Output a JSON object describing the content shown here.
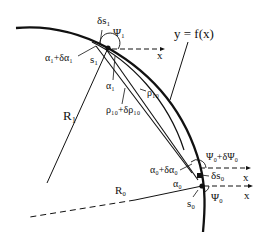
{
  "diagram": {
    "curve_label": "y = f(x)",
    "labels": {
      "delta_s1": "δs₁",
      "psi1": "Ψ₁",
      "x_top": "x",
      "alpha1_plus": "α₁+δα₁",
      "s1": "s₁",
      "alpha1": "α₁",
      "rho10": "ρ₁₀",
      "rho10_plus": "ρ₁₀+δρ₁₀",
      "R1": "R₁",
      "R0": "R₀",
      "psi0_plus": "Ψ₀+δΨ₀",
      "alpha0_plus": "α₀+δα₀",
      "delta_s0": "δs₀",
      "x_mid": "x",
      "alpha0": "α₀",
      "x_low": "x",
      "psi0": "Ψ₀",
      "s0": "s₀"
    },
    "colors": {
      "ink": "#111111",
      "background": "#ffffff"
    }
  }
}
